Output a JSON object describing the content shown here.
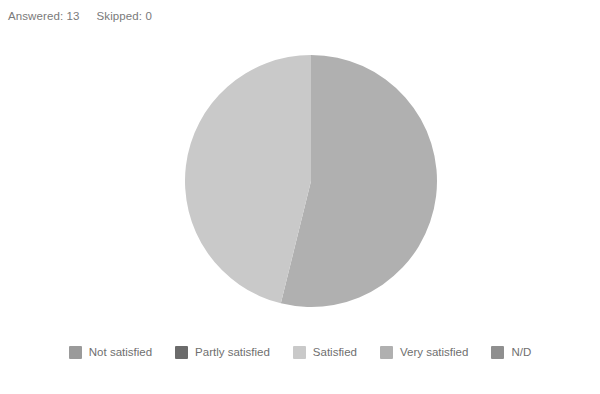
{
  "header": {
    "answered_label": "Answered: 13",
    "skipped_label": "Skipped: 0"
  },
  "legend": {
    "items": [
      {
        "label": "Not satisfied",
        "color": "#9a9a9a"
      },
      {
        "label": "Partly satisfied",
        "color": "#6b6b6b"
      },
      {
        "label": "Satisfied",
        "color": "#c9c9c9"
      },
      {
        "label": "Very satisfied",
        "color": "#b0b0b0"
      },
      {
        "label": "N/D",
        "color": "#8f8f8f"
      }
    ]
  },
  "chart_data": {
    "type": "pie",
    "title": "",
    "categories": [
      "Not satisfied",
      "Partly satisfied",
      "Satisfied",
      "Very satisfied",
      "N/D"
    ],
    "values": [
      0,
      0,
      6,
      7,
      0
    ],
    "percentages": [
      0,
      0,
      46.2,
      53.8,
      0
    ],
    "colors": [
      "#9a9a9a",
      "#6b6b6b",
      "#c9c9c9",
      "#b0b0b0",
      "#8f8f8f"
    ],
    "total": 13,
    "answered": 13,
    "skipped": 0,
    "legend_position": "bottom",
    "grid": false,
    "slices": [
      {
        "label": "Very satisfied",
        "value": 7,
        "percent": 53.8,
        "color": "#b0b0b0"
      },
      {
        "label": "Satisfied",
        "value": 6,
        "percent": 46.2,
        "color": "#c9c9c9"
      }
    ]
  }
}
